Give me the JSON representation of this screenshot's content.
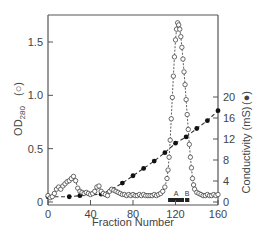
{
  "chart_data": {
    "type": "line",
    "title": "",
    "xlabel": "Fraction Number",
    "ylabel_left": "OD280 (○)",
    "ylabel_left_main": "OD",
    "ylabel_left_sub": "280",
    "ylabel_left_marker": "(○)",
    "ylabel_right": "Conductivity (mS) (●)",
    "ylabel_right_main": "Conductivity  (mS)",
    "ylabel_right_marker": "(●)",
    "xlim": [
      0,
      160
    ],
    "ylim_left": [
      0,
      1.75
    ],
    "ylim_right": [
      0,
      24
    ],
    "x_ticks": [
      0,
      40,
      80,
      120,
      160
    ],
    "y_ticks_left": [
      0,
      0.5,
      1.0,
      1.5
    ],
    "y_ticks_left_labels": [
      "0",
      "0.5",
      "1.0",
      "1.5"
    ],
    "y_ticks_right": [
      0,
      4,
      8,
      12,
      16,
      20
    ],
    "grid": false,
    "legend": "none (markers indicated in axis labels)",
    "annotations": [
      {
        "text": "A",
        "x": 122,
        "note": "pooled fractions bar"
      },
      {
        "text": "B",
        "x": 131,
        "note": "pooled fractions bar"
      }
    ],
    "pool_bars": [
      {
        "label": "A",
        "x_start": 113,
        "x_end": 128
      },
      {
        "label": "B",
        "x_start": 129,
        "x_end": 133
      }
    ],
    "series": [
      {
        "name": "OD280",
        "axis": "left",
        "marker": "open-circle",
        "line": "dashed",
        "x": [
          0,
          2,
          4,
          6,
          8,
          10,
          12,
          14,
          16,
          18,
          20,
          22,
          24,
          26,
          28,
          30,
          32,
          34,
          36,
          38,
          40,
          42,
          44,
          46,
          48,
          50,
          52,
          54,
          56,
          58,
          60,
          62,
          64,
          66,
          68,
          70,
          72,
          74,
          76,
          78,
          80,
          82,
          84,
          86,
          88,
          90,
          92,
          94,
          96,
          98,
          100,
          102,
          104,
          106,
          108,
          110,
          112,
          113,
          114,
          115,
          116,
          117,
          118,
          119,
          120,
          121,
          122,
          123,
          124,
          125,
          126,
          127,
          128,
          129,
          130,
          131,
          132,
          133,
          134,
          135,
          136,
          137,
          138,
          140,
          142,
          144,
          146,
          148,
          150,
          152,
          154,
          156,
          158,
          160
        ],
        "y": [
          0.06,
          0.04,
          0.05,
          0.08,
          0.12,
          0.14,
          0.12,
          0.15,
          0.17,
          0.19,
          0.2,
          0.22,
          0.24,
          0.2,
          0.13,
          0.1,
          0.09,
          0.08,
          0.09,
          0.08,
          0.07,
          0.08,
          0.1,
          0.14,
          0.15,
          0.1,
          0.08,
          0.07,
          0.06,
          0.1,
          0.12,
          0.11,
          0.1,
          0.09,
          0.08,
          0.07,
          0.07,
          0.06,
          0.07,
          0.06,
          0.07,
          0.06,
          0.06,
          0.07,
          0.06,
          0.07,
          0.06,
          0.06,
          0.06,
          0.06,
          0.07,
          0.06,
          0.07,
          0.08,
          0.1,
          0.14,
          0.22,
          0.3,
          0.42,
          0.58,
          0.78,
          0.98,
          1.18,
          1.36,
          1.52,
          1.62,
          1.68,
          1.66,
          1.62,
          1.55,
          1.45,
          1.34,
          1.22,
          1.1,
          0.96,
          0.82,
          0.68,
          0.54,
          0.42,
          0.32,
          0.22,
          0.16,
          0.12,
          0.09,
          0.08,
          0.07,
          0.06,
          0.06,
          0.07,
          0.06,
          0.06,
          0.07,
          0.06,
          0.07
        ]
      },
      {
        "name": "Conductivity",
        "axis": "right",
        "marker": "filled-circle",
        "line": "dashed",
        "x": [
          0,
          20,
          30,
          50,
          60,
          70,
          80,
          90,
          100,
          110,
          120,
          130,
          140,
          150,
          160
        ],
        "y": [
          1.0,
          1.0,
          1.2,
          1.5,
          2.4,
          3.6,
          5.0,
          6.4,
          7.8,
          9.4,
          11.2,
          12.4,
          14.0,
          15.5,
          17.4
        ]
      }
    ]
  }
}
